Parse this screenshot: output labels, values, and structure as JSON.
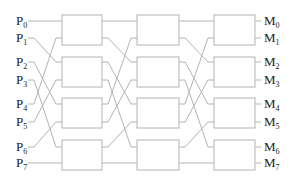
{
  "diagram": {
    "type": "omega-network",
    "inputs": [
      {
        "prefix": "P",
        "sub": "0"
      },
      {
        "prefix": "P",
        "sub": "1"
      },
      {
        "prefix": "P",
        "sub": "2"
      },
      {
        "prefix": "P",
        "sub": "3"
      },
      {
        "prefix": "P",
        "sub": "4"
      },
      {
        "prefix": "P",
        "sub": "5"
      },
      {
        "prefix": "P",
        "sub": "6"
      },
      {
        "prefix": "P",
        "sub": "7"
      }
    ],
    "outputs": [
      {
        "prefix": "M",
        "sub": "0"
      },
      {
        "prefix": "M",
        "sub": "1"
      },
      {
        "prefix": "M",
        "sub": "2"
      },
      {
        "prefix": "M",
        "sub": "3"
      },
      {
        "prefix": "M",
        "sub": "4"
      },
      {
        "prefix": "M",
        "sub": "5"
      },
      {
        "prefix": "M",
        "sub": "6"
      },
      {
        "prefix": "M",
        "sub": "7"
      }
    ],
    "stages": 3,
    "switches_per_stage": 4,
    "interstage_wiring": "perfect-shuffle",
    "colors": {
      "line": "#b4b4b4",
      "text": "#222222",
      "background": "#ffffff"
    }
  }
}
